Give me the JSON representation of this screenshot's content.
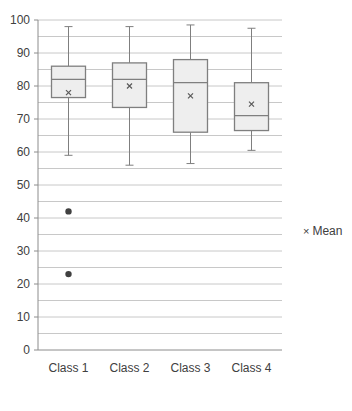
{
  "chart_data": {
    "type": "box",
    "title": "",
    "xlabel": "",
    "ylabel": "",
    "ylim": [
      0,
      100
    ],
    "yticks": [
      0,
      10,
      20,
      30,
      40,
      50,
      60,
      70,
      80,
      90,
      100
    ],
    "minor_gridlines": [
      5,
      15,
      25,
      35,
      45,
      55,
      65,
      75,
      85,
      95
    ],
    "grid": true,
    "categories": [
      "Class 1",
      "Class 2",
      "Class 3",
      "Class 4"
    ],
    "series": [
      {
        "name": "Class 1",
        "min": 59,
        "q1": 76.5,
        "median": 82,
        "q3": 86,
        "max": 98,
        "mean": 78,
        "outliers": [
          42,
          23
        ]
      },
      {
        "name": "Class 2",
        "min": 56,
        "q1": 73.5,
        "median": 82,
        "q3": 87,
        "max": 98,
        "mean": 80,
        "outliers": []
      },
      {
        "name": "Class 3",
        "min": 56.5,
        "q1": 66,
        "median": 81,
        "q3": 88,
        "max": 98.5,
        "mean": 77,
        "outliers": []
      },
      {
        "name": "Class 4",
        "min": 60.5,
        "q1": 66.5,
        "median": 71,
        "q3": 81,
        "max": 97.5,
        "mean": 74.5,
        "outliers": []
      }
    ],
    "legend": {
      "position": "right",
      "entries": [
        {
          "marker": "×",
          "label": "Mean"
        }
      ]
    },
    "colors": {
      "box_fill": "#eeeeee",
      "box_stroke": "#7f7f7f",
      "whisker": "#7f7f7f",
      "grid": "#c8c8c8",
      "outlier": "#404040",
      "mean_marker": "#595959",
      "axis": "#8c8c8c"
    }
  }
}
